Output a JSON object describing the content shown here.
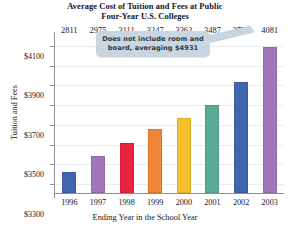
{
  "chart_data": {
    "type": "bar",
    "title": "Average Cost of Tuition and Fees at Public Four-Year U.S. Colleges",
    "title_line1": "Average Cost of Tuition and Fees at Public",
    "title_line2": "Four-Year U.S. Colleges",
    "xlabel": "Ending Year in the School Year",
    "ylabel": "Tuition and Fees",
    "categories": [
      "1996",
      "1997",
      "1998",
      "1999",
      "2000",
      "2001",
      "2002",
      "2003"
    ],
    "values": [
      2811,
      2975,
      3111,
      3247,
      3362,
      3487,
      3725,
      4081
    ],
    "value_labels": [
      "2811",
      "2975",
      "3111",
      "3247",
      "3362",
      "3487",
      "3725",
      "4081"
    ],
    "ytick_labels": [
      "$4100",
      "$3900",
      "$3700",
      "$3500",
      "$3300",
      "$3100",
      "$2900",
      "$2700"
    ],
    "ytick_values": [
      4100,
      3900,
      3700,
      3500,
      3300,
      3100,
      2900,
      2700
    ],
    "ylim": [
      2600,
      4200
    ],
    "grid": true,
    "legend": "none",
    "bar_colors": [
      "#4166b0",
      "#a176b8",
      "#e8223f",
      "#f08538",
      "#f5c02c",
      "#5aab94",
      "#4166b0",
      "#a176b8"
    ],
    "annotations": [
      {
        "name": "room-and-board-note",
        "line1": "Does not include room and",
        "line2": "board, averaging $4931",
        "fill_color": "#c9d5e1",
        "text_color": "#2c3742",
        "points_to": "2003"
      }
    ]
  }
}
